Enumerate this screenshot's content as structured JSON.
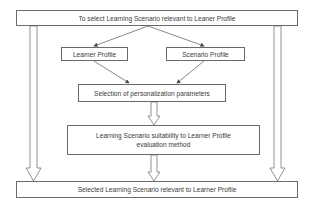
{
  "diagram": {
    "type": "flowchart",
    "nodes": {
      "top": {
        "label": "To select Learning Scenario relevant to Leaner Profile"
      },
      "learner_profile": {
        "label": "Learner Profile"
      },
      "scenario_profile": {
        "label": "Scenario Profile"
      },
      "selection": {
        "label": "Selection of personalization parameters"
      },
      "evaluation": {
        "label": "Learning Scenario suitability to Learner Profile evaluation method"
      },
      "bottom": {
        "label": "Selected Learning Scenario relevant to Learner Profile"
      }
    },
    "edges": [
      {
        "from": "top",
        "to": "learner_profile",
        "style": "line-arrow"
      },
      {
        "from": "top",
        "to": "scenario_profile",
        "style": "line-arrow"
      },
      {
        "from": "learner_profile",
        "to": "selection",
        "style": "line-arrow"
      },
      {
        "from": "scenario_profile",
        "to": "selection",
        "style": "line-arrow"
      },
      {
        "from": "selection",
        "to": "evaluation",
        "style": "hollow-arrow"
      },
      {
        "from": "evaluation",
        "to": "bottom",
        "style": "hollow-arrow"
      },
      {
        "from": "top",
        "to": "bottom",
        "style": "hollow-arrow",
        "side": "left"
      },
      {
        "from": "top",
        "to": "bottom",
        "style": "hollow-arrow",
        "side": "right"
      }
    ],
    "colors": {
      "stroke": "#6a6a6a",
      "text": "#3a3a3a",
      "background": "#ffffff"
    }
  }
}
